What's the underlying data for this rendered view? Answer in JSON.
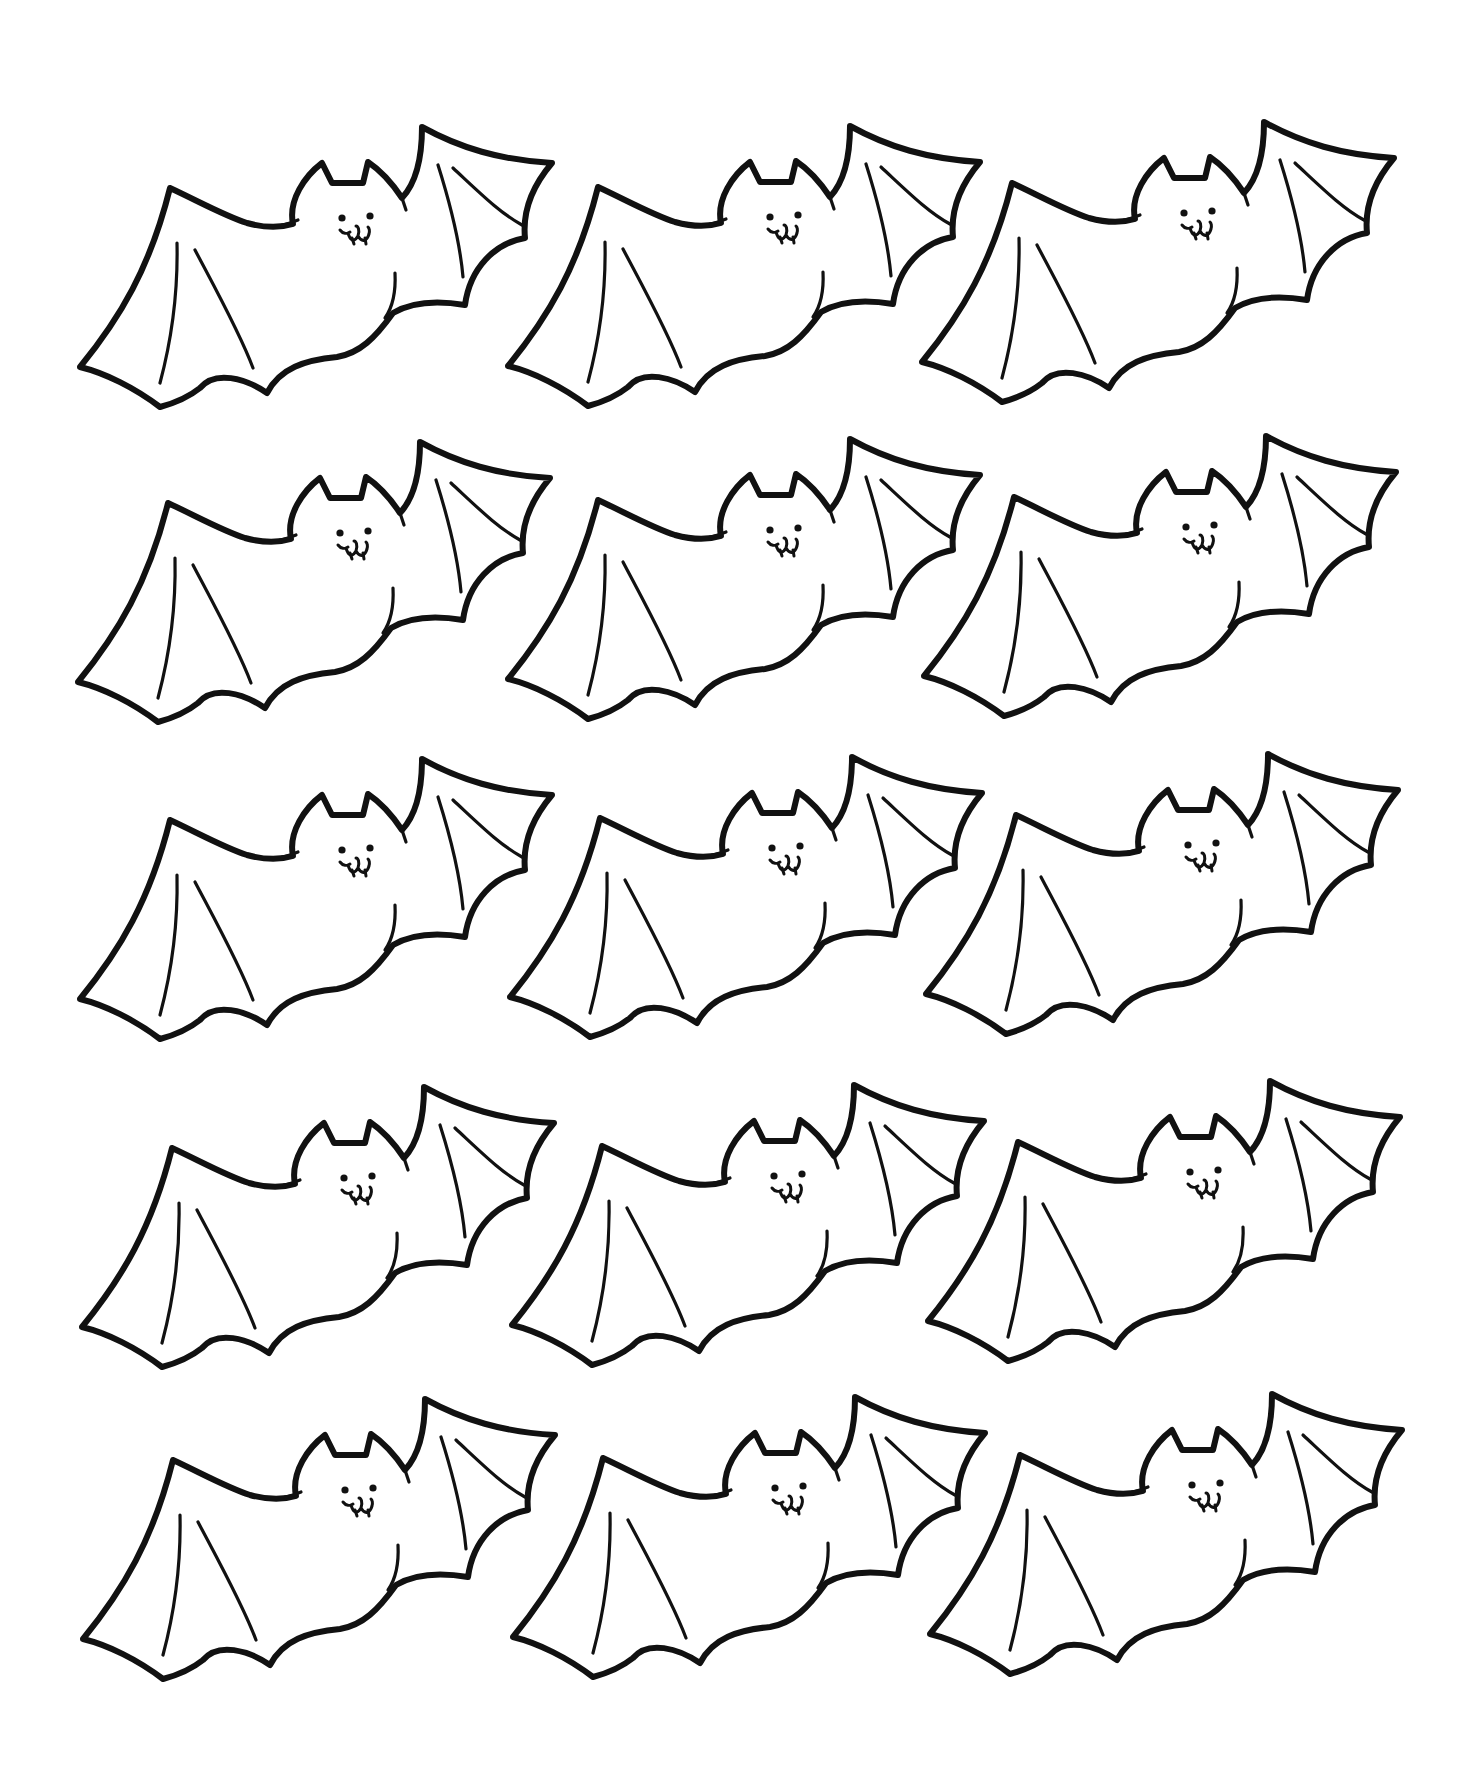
{
  "page": {
    "background": "#ffffff",
    "line_color": "#111111"
  },
  "grid": {
    "rows": 5,
    "columns": 3,
    "bat_count": 15,
    "origins": [
      [
        [
          170,
          188
        ],
        [
          598,
          187
        ],
        [
          1012,
          183
        ]
      ],
      [
        [
          168,
          503
        ],
        [
          598,
          500
        ],
        [
          1014,
          497
        ]
      ],
      [
        [
          170,
          820
        ],
        [
          600,
          818
        ],
        [
          1016,
          815
        ]
      ],
      [
        [
          172,
          1148
        ],
        [
          602,
          1146
        ],
        [
          1018,
          1142
        ]
      ],
      [
        [
          173,
          1460
        ],
        [
          603,
          1458
        ],
        [
          1020,
          1455
        ]
      ]
    ]
  },
  "bat": {
    "icon": "bat-icon",
    "parts": [
      "left-wing",
      "head",
      "left-ear",
      "right-ear",
      "face",
      "right-wing",
      "body"
    ]
  }
}
